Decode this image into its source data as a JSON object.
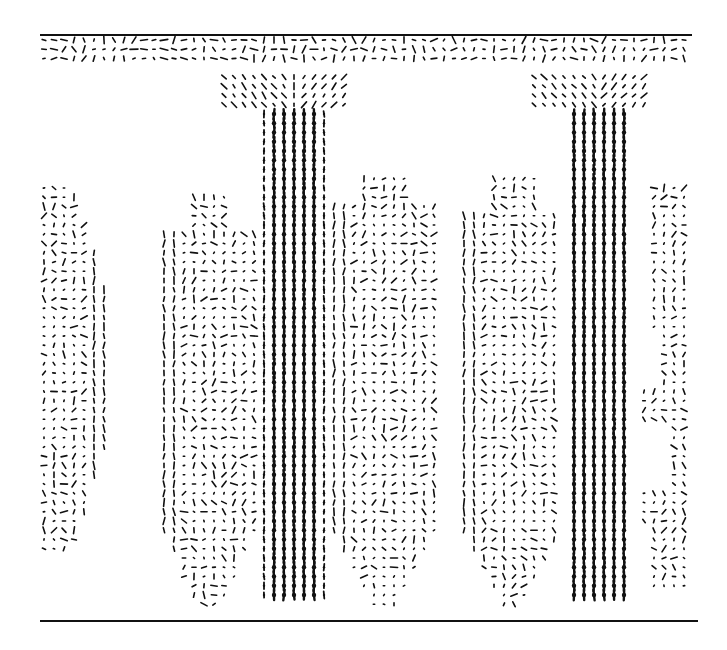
{
  "figure": {
    "description": "Vector (quiver) plot of a velocity field showing two strong descending plumes between two horizontal boundaries",
    "ink_color": "#111111",
    "background": "#ffffff"
  },
  "chart_data": {
    "type": "quiver",
    "title": "",
    "xlabel": "",
    "ylabel": "",
    "grid": false,
    "legend": null,
    "axis_ticks": [],
    "boundaries": [
      {
        "name": "top-boundary",
        "y": 35,
        "x0": 40,
        "x1": 692,
        "width": 2
      },
      {
        "name": "bottom-boundary",
        "y": 621,
        "x0": 40,
        "x1": 698,
        "width": 2
      }
    ],
    "sample_grid": {
      "x0": 44,
      "dx": 10,
      "nx": 65,
      "y0": 40,
      "dy": 9.25,
      "ny": 62
    },
    "regions": [
      {
        "name": "top-layer",
        "x0": 44,
        "x1": 688,
        "y0": 40,
        "y1": 59,
        "style": "horizontal-shear",
        "strength": 0.55
      },
      {
        "name": "top-layer-fringe",
        "x0": 44,
        "x1": 688,
        "y0": 68,
        "y1": 68,
        "style": "sparse",
        "strength": 0.25,
        "fill": 0.3
      },
      {
        "name": "plume-a-neck",
        "x0": 224,
        "x1": 344,
        "y0": 68,
        "y1": 110,
        "style": "converging",
        "cx": 294,
        "strength": 0.6
      },
      {
        "name": "plume-a-stem",
        "x0": 264,
        "x1": 324,
        "y0": 110,
        "y1": 600,
        "style": "downflow",
        "cx": 294,
        "strength": 1.0
      },
      {
        "name": "plume-b-neck",
        "x0": 528,
        "x1": 648,
        "y0": 68,
        "y1": 110,
        "style": "converging",
        "cx": 598,
        "strength": 0.6
      },
      {
        "name": "plume-b-stem",
        "x0": 568,
        "x1": 628,
        "y0": 110,
        "y1": 600,
        "style": "downflow",
        "cx": 598,
        "strength": 1.0
      },
      {
        "name": "left-cell",
        "x0": 44,
        "x1": 114,
        "y0": 180,
        "y1": 555,
        "style": "circulation",
        "shape": "left-arc",
        "strength": 0.45
      },
      {
        "name": "cell-a-left",
        "x0": 164,
        "x1": 254,
        "y0": 195,
        "y1": 610,
        "style": "circulation",
        "shape": "rounded",
        "strength": 0.45
      },
      {
        "name": "cell-a-right",
        "x0": 334,
        "x1": 434,
        "y0": 170,
        "y1": 610,
        "style": "circulation",
        "shape": "rounded",
        "strength": 0.45
      },
      {
        "name": "cell-b-left",
        "x0": 464,
        "x1": 558,
        "y0": 175,
        "y1": 610,
        "style": "circulation",
        "shape": "rounded",
        "strength": 0.45
      },
      {
        "name": "cell-b-right",
        "x0": 638,
        "x1": 688,
        "y0": 185,
        "y1": 590,
        "style": "circulation",
        "shape": "right-edge",
        "strength": 0.4
      }
    ],
    "plumes": [
      {
        "name": "plume-a",
        "center_x": 294,
        "width_px": 60,
        "top_y": 40,
        "bottom_y": 610,
        "direction": "down"
      },
      {
        "name": "plume-b",
        "center_x": 598,
        "width_px": 60,
        "top_y": 40,
        "bottom_y": 610,
        "direction": "down"
      }
    ],
    "seed": 7
  }
}
